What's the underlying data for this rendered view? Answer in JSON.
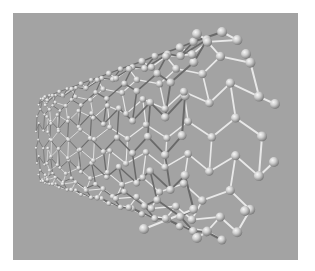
{
  "image": {
    "subject": "carbon nanotube 3D ball-and-stick model",
    "width": 315,
    "height": 271,
    "colors": {
      "page_background": "#ffffff",
      "panel_background": "#a3a3a3",
      "atom_highlight": "#f4f4f4",
      "atom_mid": "#c8c8c8",
      "atom_shadow": "#7e7e7e",
      "bond_light": "#ececec",
      "bond_dark": "#5a5a5a"
    },
    "panel": {
      "x": 13,
      "y": 13,
      "width": 285,
      "height": 247
    }
  },
  "tube": {
    "axis_start": [
      42,
      140
    ],
    "axis_end": [
      245,
      135
    ],
    "rings": 14,
    "atoms_per_ring": 16,
    "terminal_atoms": [
      [
        197,
        34
      ],
      [
        246,
        54
      ],
      [
        275,
        104
      ],
      [
        274,
        162
      ],
      [
        245,
        211
      ],
      [
        197,
        238
      ],
      [
        144,
        229
      ]
    ]
  }
}
